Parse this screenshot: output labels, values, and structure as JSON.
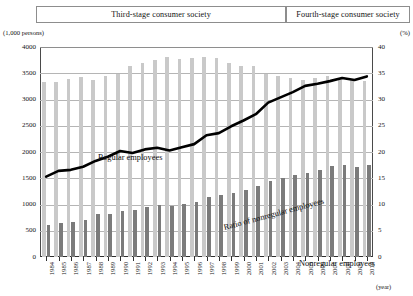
{
  "banners": {
    "third": "Third-stage consumer society",
    "fourth": "Fourth-stage consumer society"
  },
  "axis_units": {
    "left": "(1,000 persons)",
    "right": "(%)"
  },
  "x_caption": "(year)",
  "annotations": {
    "regular": "Regular employees",
    "nonregular": "Nonregular employees",
    "ratio": "Ratio of nonregular employees"
  },
  "colors": {
    "regular_bar": "#c9c9c9",
    "nonregular_bar": "#7b7b7b",
    "ratio_line": "#000000",
    "gridline": "#b5b5b5",
    "axis": "#2e2e2e"
  },
  "chart_data": {
    "type": "bar",
    "title": "",
    "xlabel": "(year)",
    "ylabel": "(1,000 persons)",
    "y2label": "(%)",
    "ylim": [
      0,
      4000
    ],
    "y2lim": [
      0,
      40
    ],
    "yticks": [
      0,
      500,
      1000,
      1500,
      2000,
      2500,
      3000,
      3500,
      4000
    ],
    "y2ticks": [
      0,
      5,
      10,
      15,
      20,
      25,
      30,
      35,
      40
    ],
    "grid": true,
    "legend": "inline-annotations",
    "categories": [
      "1984",
      "1985",
      "1986",
      "1987",
      "1988",
      "1989",
      "1990",
      "1991",
      "1992",
      "1993",
      "1994",
      "1995",
      "1996",
      "1997",
      "1998",
      "1999",
      "2000",
      "2001",
      "2002",
      "2003",
      "2004",
      "2005",
      "2006",
      "2007",
      "2008",
      "2009",
      "2010"
    ],
    "series": [
      {
        "name": "Regular employees",
        "type": "bar",
        "axis": "left",
        "color": "#c9c9c9",
        "values": [
          3333,
          3343,
          3383,
          3430,
          3377,
          3452,
          3488,
          3639,
          3705,
          3756,
          3805,
          3779,
          3800,
          3812,
          3794,
          3688,
          3630,
          3640,
          3489,
          3444,
          3410,
          3375,
          3415,
          3449,
          3410,
          3380,
          3355
        ]
      },
      {
        "name": "Nonregular employees",
        "type": "bar",
        "axis": "left",
        "color": "#7b7b7b",
        "values": [
          604,
          655,
          673,
          711,
          817,
          817,
          881,
          897,
          958,
          986,
          971,
          1001,
          1043,
          1152,
          1173,
          1225,
          1273,
          1360,
          1451,
          1504,
          1555,
          1591,
          1663,
          1726,
          1760,
          1721,
          1756
        ]
      },
      {
        "name": "Ratio of nonregular employees",
        "type": "line",
        "axis": "right",
        "color": "#000000",
        "unit": "%",
        "values": [
          15.3,
          16.4,
          16.6,
          17.2,
          18.3,
          19.1,
          20.2,
          19.8,
          20.5,
          20.8,
          20.3,
          20.9,
          21.5,
          23.2,
          23.6,
          24.9,
          26.0,
          27.2,
          29.4,
          30.4,
          31.4,
          32.6,
          33.0,
          33.5,
          34.1,
          33.7,
          34.4
        ]
      }
    ]
  }
}
